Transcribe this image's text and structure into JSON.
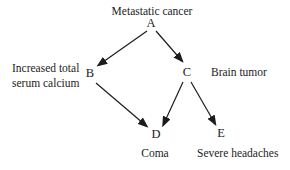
{
  "diagram": {
    "type": "directed-causal-graph",
    "nodes": {
      "a": {
        "letter": "A",
        "caption": "Metastatic cancer"
      },
      "b": {
        "letter": "B",
        "caption_line1": "Increased total",
        "caption_line2": "serum calcium"
      },
      "c": {
        "letter": "C",
        "caption": "Brain tumor"
      },
      "d": {
        "letter": "D",
        "caption": "Coma"
      },
      "e": {
        "letter": "E",
        "caption": "Severe headaches"
      }
    },
    "edges": [
      {
        "from": "A",
        "to": "B"
      },
      {
        "from": "A",
        "to": "C"
      },
      {
        "from": "B",
        "to": "D"
      },
      {
        "from": "C",
        "to": "D"
      },
      {
        "from": "C",
        "to": "E"
      }
    ],
    "colors": {
      "background": "#ffffff",
      "text": "#1c1c1c",
      "arrow": "#1c1c1c"
    }
  }
}
